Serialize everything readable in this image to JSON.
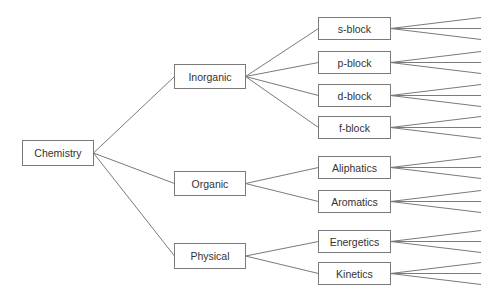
{
  "diagram": {
    "type": "tree",
    "orientation": "left-to-right",
    "colors": {
      "stroke": "#7a7a7a",
      "text": "#333333",
      "background": "#ffffff",
      "node_fill": "#ffffff"
    },
    "root": {
      "id": "chemistry",
      "label": "Chemistry",
      "x": 22,
      "y": 140,
      "w": 71,
      "h": 25
    },
    "level1": [
      {
        "id": "inorganic",
        "label": "Inorganic",
        "x": 174,
        "y": 64,
        "w": 71,
        "h": 24
      },
      {
        "id": "organic",
        "label": "Organic",
        "x": 174,
        "y": 171,
        "w": 71,
        "h": 24
      },
      {
        "id": "physical",
        "label": "Physical",
        "x": 174,
        "y": 243,
        "w": 71,
        "h": 25
      }
    ],
    "level2": [
      {
        "id": "s-block",
        "label": "s-block",
        "parent": "inorganic",
        "x": 318,
        "y": 17,
        "w": 72,
        "h": 22
      },
      {
        "id": "p-block",
        "label": "p-block",
        "parent": "inorganic",
        "x": 318,
        "y": 51,
        "w": 72,
        "h": 22
      },
      {
        "id": "d-block",
        "label": "d-block",
        "parent": "inorganic",
        "x": 318,
        "y": 84,
        "w": 72,
        "h": 22
      },
      {
        "id": "f-block",
        "label": "f-block",
        "parent": "inorganic",
        "x": 318,
        "y": 116,
        "w": 72,
        "h": 22
      },
      {
        "id": "aliphatics",
        "label": "Aliphatics",
        "parent": "organic",
        "x": 318,
        "y": 156,
        "w": 72,
        "h": 22
      },
      {
        "id": "aromatics",
        "label": "Aromatics",
        "parent": "organic",
        "x": 318,
        "y": 190,
        "w": 72,
        "h": 22
      },
      {
        "id": "energetics",
        "label": "Energetics",
        "parent": "physical",
        "x": 318,
        "y": 230,
        "w": 72,
        "h": 22
      },
      {
        "id": "kinetics",
        "label": "Kinetics",
        "parent": "physical",
        "x": 318,
        "y": 262,
        "w": 72,
        "h": 22
      }
    ],
    "leaf_fan": {
      "count_per_node": 3,
      "end_x": 481,
      "spread": 11
    }
  }
}
